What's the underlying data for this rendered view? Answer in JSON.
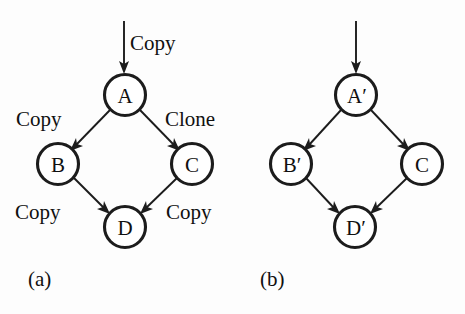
{
  "figure": {
    "background_color": "#fdfdfd",
    "ink_color": "#1c1c1c",
    "panels": [
      {
        "id": "panel-a",
        "caption": "(a)",
        "nodes": [
          {
            "id": "A",
            "label": "A",
            "cx": 125,
            "cy": 95,
            "r": 20.5
          },
          {
            "id": "B",
            "label": "B",
            "cx": 58,
            "cy": 164,
            "r": 20.5
          },
          {
            "id": "C",
            "label": "C",
            "cx": 192,
            "cy": 164,
            "r": 20.5
          },
          {
            "id": "D",
            "label": "D",
            "cx": 125,
            "cy": 227,
            "r": 20.5
          }
        ],
        "entry_arrow": {
          "x": 124,
          "y1": 21,
          "y2": 72,
          "label": "Copy"
        },
        "edges": [
          {
            "from": "A",
            "to": "B",
            "label": "Copy"
          },
          {
            "from": "A",
            "to": "C",
            "label": "Clone"
          },
          {
            "from": "B",
            "to": "D",
            "label": "Copy"
          },
          {
            "from": "C",
            "to": "D",
            "label": "Copy"
          }
        ],
        "labels": {
          "entry": {
            "text": "Copy",
            "x": 130,
            "y": 50
          },
          "a_to_b": {
            "text": "Copy",
            "x": 16,
            "y": 126
          },
          "a_to_c": {
            "text": "Clone",
            "x": 165,
            "y": 126
          },
          "b_to_d": {
            "text": "Copy",
            "x": 15,
            "y": 219
          },
          "c_to_d": {
            "text": "Copy",
            "x": 166,
            "y": 219
          }
        },
        "caption_pos": {
          "x": 28,
          "y": 286
        }
      },
      {
        "id": "panel-b",
        "caption": "(b)",
        "nodes": [
          {
            "id": "Ap",
            "label": "A′",
            "cx": 356,
            "cy": 95,
            "r": 20.5
          },
          {
            "id": "Bp",
            "label": "B′",
            "cx": 291,
            "cy": 164,
            "r": 20.5
          },
          {
            "id": "C2",
            "label": "C",
            "cx": 422,
            "cy": 164,
            "r": 20.5
          },
          {
            "id": "Dp",
            "label": "D′",
            "cx": 355,
            "cy": 227,
            "r": 20.5
          }
        ],
        "entry_arrow": {
          "x": 356,
          "y1": 21,
          "y2": 72,
          "label": ""
        },
        "edges": [
          {
            "from": "Ap",
            "to": "Bp",
            "label": ""
          },
          {
            "from": "Ap",
            "to": "C2",
            "label": ""
          },
          {
            "from": "Bp",
            "to": "Dp",
            "label": ""
          },
          {
            "from": "C2",
            "to": "Dp",
            "label": ""
          }
        ],
        "labels": {},
        "caption_pos": {
          "x": 260,
          "y": 286
        }
      }
    ]
  }
}
